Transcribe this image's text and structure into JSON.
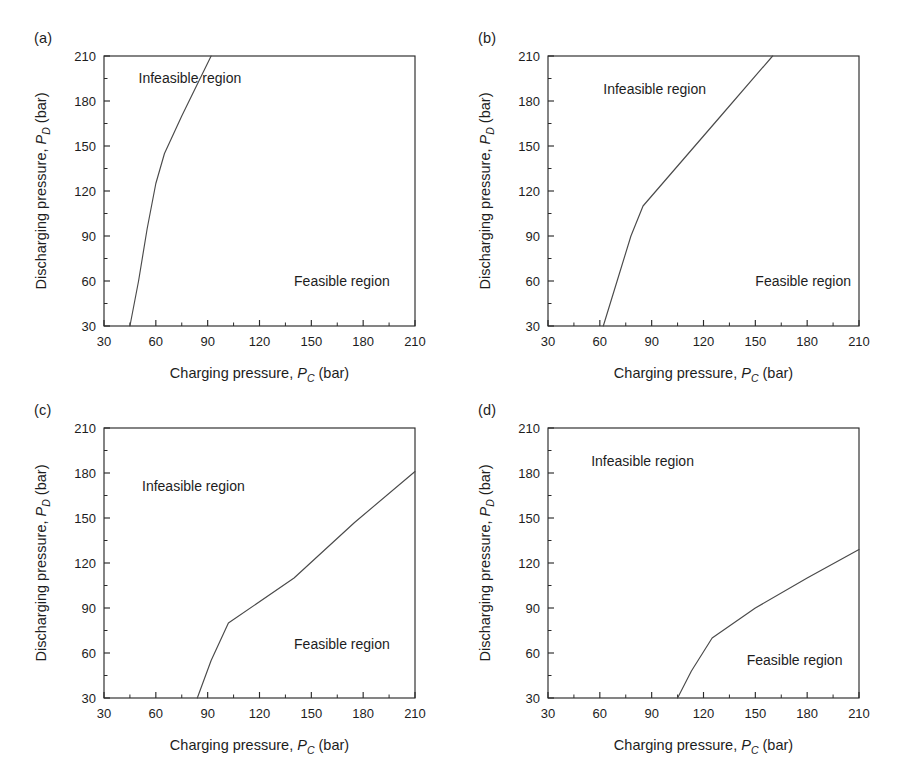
{
  "figure": {
    "background": "#ffffff",
    "line_color": "#4a4a4a",
    "axis_color": "#2a2a2a",
    "panel_count": 4
  },
  "common": {
    "xlabel_prefix": "Charging pressure, ",
    "xlabel_symbol": "P",
    "xlabel_subscript": "C",
    "xlabel_suffix": " (bar)",
    "ylabel_prefix": "Discharging pressure, ",
    "ylabel_symbol": "P",
    "ylabel_subscript": "D",
    "ylabel_suffix": " (bar)",
    "xticks": [
      30,
      60,
      90,
      120,
      150,
      180,
      210
    ],
    "yticks": [
      30,
      60,
      90,
      120,
      150,
      180,
      210
    ],
    "xlim": [
      30,
      210
    ],
    "ylim": [
      30,
      210
    ],
    "infeasible_label": "Infeasible region",
    "feasible_label": "Feasible region"
  },
  "panels": [
    {
      "id": "a",
      "label": "(a)",
      "infeasible_label": "Infeasible region",
      "feasible_label": "Feasible region",
      "infeasible_pos": [
        50,
        192
      ],
      "feasible_pos": [
        140,
        57
      ],
      "boundary": [
        [
          45,
          30
        ],
        [
          50,
          60
        ],
        [
          55,
          95
        ],
        [
          60,
          125
        ],
        [
          65,
          145
        ],
        [
          75,
          170
        ],
        [
          92,
          210
        ]
      ]
    },
    {
      "id": "b",
      "label": "(b)",
      "infeasible_label": "Infeasible region",
      "feasible_label": "Feasible region",
      "infeasible_pos": [
        62,
        185
      ],
      "feasible_pos": [
        150,
        57
      ],
      "boundary": [
        [
          62,
          30
        ],
        [
          70,
          60
        ],
        [
          78,
          90
        ],
        [
          85,
          110
        ],
        [
          100,
          130
        ],
        [
          130,
          170
        ],
        [
          160,
          210
        ]
      ]
    },
    {
      "id": "c",
      "label": "(c)",
      "infeasible_label": "Infeasible region",
      "feasible_label": "Feasible region",
      "infeasible_pos": [
        52,
        168
      ],
      "feasible_pos": [
        140,
        63
      ],
      "boundary": [
        [
          84,
          30
        ],
        [
          92,
          55
        ],
        [
          102,
          80
        ],
        [
          140,
          110
        ],
        [
          175,
          147
        ],
        [
          210,
          181
        ]
      ]
    },
    {
      "id": "d",
      "label": "(d)",
      "infeasible_label": "Infeasible region",
      "feasible_label": "Feasible region",
      "infeasible_pos": [
        55,
        185
      ],
      "feasible_pos": [
        145,
        52
      ],
      "boundary": [
        [
          105,
          30
        ],
        [
          113,
          48
        ],
        [
          125,
          70
        ],
        [
          150,
          90
        ],
        [
          180,
          110
        ],
        [
          210,
          129
        ]
      ]
    }
  ],
  "chart_data": {
    "type": "line",
    "title": "",
    "xlabel": "Charging pressure, P_C (bar)",
    "ylabel": "Discharging pressure, P_D (bar)",
    "xlim": [
      30,
      210
    ],
    "ylim": [
      30,
      210
    ],
    "grid": false,
    "legend": "none",
    "annotations": [
      "Infeasible region",
      "Feasible region"
    ],
    "subplots": [
      {
        "panel": "(a)",
        "series_name": "feasibility boundary",
        "x": [
          45,
          50,
          55,
          60,
          65,
          75,
          92
        ],
        "y": [
          30,
          60,
          95,
          125,
          145,
          170,
          210
        ]
      },
      {
        "panel": "(b)",
        "series_name": "feasibility boundary",
        "x": [
          62,
          70,
          78,
          85,
          100,
          130,
          160
        ],
        "y": [
          30,
          60,
          90,
          110,
          130,
          170,
          210
        ]
      },
      {
        "panel": "(c)",
        "series_name": "feasibility boundary",
        "x": [
          84,
          92,
          102,
          140,
          175,
          210
        ],
        "y": [
          30,
          55,
          80,
          110,
          147,
          181
        ]
      },
      {
        "panel": "(d)",
        "series_name": "feasibility boundary",
        "x": [
          105,
          113,
          125,
          150,
          180,
          210
        ],
        "y": [
          30,
          48,
          70,
          90,
          110,
          129
        ]
      }
    ]
  }
}
